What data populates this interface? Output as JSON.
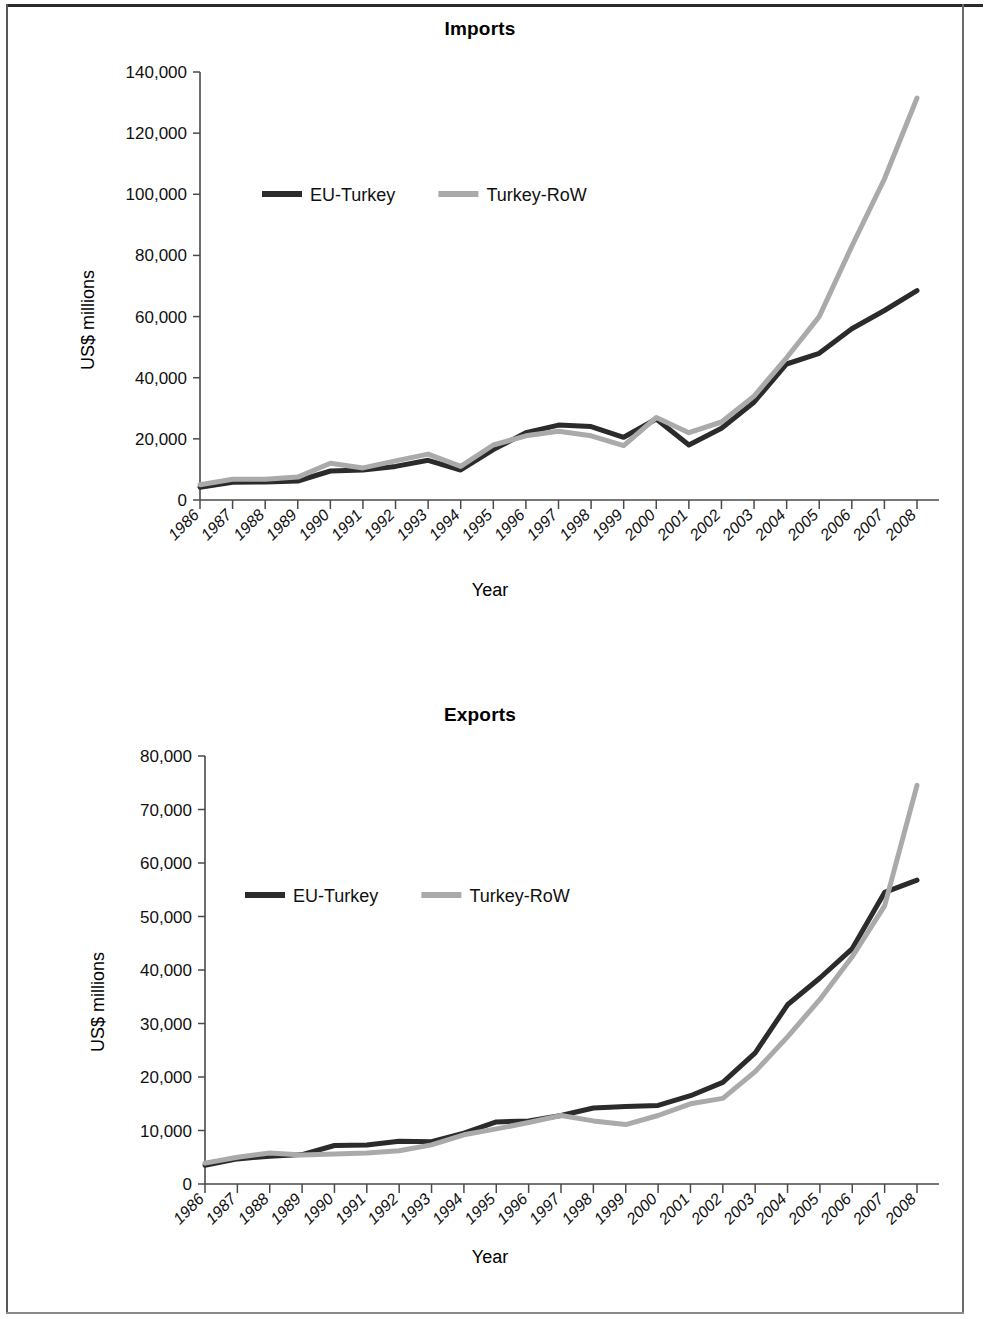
{
  "page": {
    "background_color": "#ffffff",
    "border_color": "#575757"
  },
  "charts": [
    {
      "id": "imports",
      "title": "Imports",
      "ylabel": "US$ millions",
      "xlabel": "Year",
      "legend": [
        {
          "label": "EU-Turkey",
          "color": "#2b2b2b"
        },
        {
          "label": "Turkey-RoW",
          "color": "#aaaaaa"
        }
      ]
    },
    {
      "id": "exports",
      "title": "Exports",
      "ylabel": "US$ millions",
      "xlabel": "Year",
      "legend": [
        {
          "label": "EU-Turkey",
          "color": "#2b2b2b"
        },
        {
          "label": "Turkey-RoW",
          "color": "#aaaaaa"
        }
      ]
    }
  ],
  "chart_data": [
    {
      "type": "line",
      "title": "Imports",
      "xlabel": "Year",
      "ylabel": "US$ millions",
      "grid": false,
      "legend_position": "inside-upper-left",
      "x": [
        1986,
        1987,
        1988,
        1989,
        1990,
        1991,
        1992,
        1993,
        1994,
        1995,
        1996,
        1997,
        1998,
        1999,
        2000,
        2001,
        2002,
        2003,
        2004,
        2005,
        2006,
        2007,
        2008
      ],
      "xtick_labels": [
        "1986",
        "1987",
        "1988",
        "1989",
        "1990",
        "1991",
        "1992",
        "1993",
        "1994",
        "1995",
        "1996",
        "1997",
        "1998",
        "1999",
        "2000",
        "2001",
        "2002",
        "2003",
        "2004",
        "2005",
        "2006",
        "2007",
        "2008"
      ],
      "ylim": [
        0,
        140000
      ],
      "ytick_labels": [
        "0",
        "20,000",
        "40,000",
        "60,000",
        "80,000",
        "100,000",
        "120,000",
        "140,000"
      ],
      "yticks": [
        0,
        20000,
        40000,
        60000,
        80000,
        100000,
        120000,
        140000
      ],
      "series": [
        {
          "name": "EU-Turkey",
          "color": "#2b2b2b",
          "values": [
            4200,
            5800,
            5900,
            6200,
            9500,
            9800,
            11000,
            13000,
            9800,
            16500,
            22000,
            24500,
            24000,
            20500,
            26500,
            18000,
            23500,
            32000,
            44500,
            48000,
            56000,
            62000,
            68500
          ]
        },
        {
          "name": "Turkey-RoW",
          "color": "#aaaaaa",
          "values": [
            5000,
            6800,
            6800,
            7500,
            12000,
            10500,
            12800,
            15000,
            11000,
            18000,
            21000,
            22500,
            21000,
            17800,
            27000,
            22000,
            25500,
            34000,
            46500,
            60000,
            83000,
            105000,
            131500
          ]
        }
      ]
    },
    {
      "type": "line",
      "title": "Exports",
      "xlabel": "Year",
      "ylabel": "US$ millions",
      "grid": false,
      "legend_position": "inside-upper-left",
      "x": [
        1986,
        1987,
        1988,
        1989,
        1990,
        1991,
        1992,
        1993,
        1994,
        1995,
        1996,
        1997,
        1998,
        1999,
        2000,
        2001,
        2002,
        2003,
        2004,
        2005,
        2006,
        2007,
        2008
      ],
      "xtick_labels": [
        "1986",
        "1987",
        "1988",
        "1989",
        "1990",
        "1991",
        "1992",
        "1993",
        "1994",
        "1995",
        "1996",
        "1997",
        "1998",
        "1999",
        "2000",
        "2001",
        "2002",
        "2003",
        "2004",
        "2005",
        "2006",
        "2007",
        "2008"
      ],
      "ylim": [
        0,
        80000
      ],
      "ytick_labels": [
        "0",
        "10,000",
        "20,000",
        "30,000",
        "40,000",
        "50,000",
        "60,000",
        "70,000",
        "80,000"
      ],
      "yticks": [
        0,
        10000,
        20000,
        30000,
        40000,
        50000,
        60000,
        70000,
        80000
      ],
      "series": [
        {
          "name": "EU-Turkey",
          "color": "#2b2b2b",
          "values": [
            3500,
            4700,
            5200,
            5500,
            7200,
            7300,
            8000,
            7900,
            9500,
            11600,
            11800,
            12800,
            14200,
            14500,
            14700,
            16500,
            19000,
            24500,
            33500,
            38500,
            44000,
            54500,
            56800
          ]
        },
        {
          "name": "Turkey-RoW",
          "color": "#aaaaaa",
          "values": [
            3900,
            5000,
            5800,
            5400,
            5600,
            5800,
            6200,
            7300,
            9200,
            10300,
            11500,
            12800,
            11800,
            11100,
            12800,
            15000,
            16000,
            21000,
            27500,
            34500,
            42500,
            52000,
            74500
          ]
        }
      ]
    }
  ]
}
